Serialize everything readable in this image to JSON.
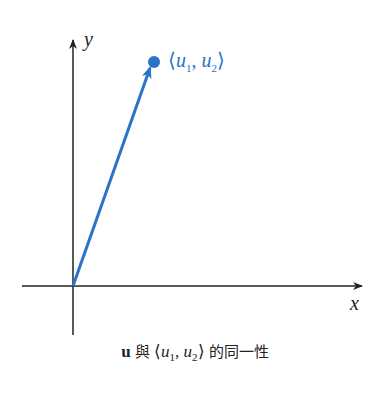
{
  "figure": {
    "x_axis_label": "x",
    "y_axis_label": "y",
    "point_label": "⟨u₁, u₂⟩",
    "point_label_parts": {
      "open": "⟨",
      "a": "u",
      "a_sub": "1",
      "sep": ", ",
      "b": "u",
      "b_sub": "2",
      "close": "⟩"
    },
    "vector_color": "#2a73c9",
    "axis_color": "#222222"
  },
  "caption": {
    "bold": "u",
    "text1": "與",
    "open": "⟨",
    "a": "u",
    "a_sub": "1",
    "sep": ", ",
    "b": "u",
    "b_sub": "2",
    "close": "⟩",
    "text2": "的同一性"
  }
}
